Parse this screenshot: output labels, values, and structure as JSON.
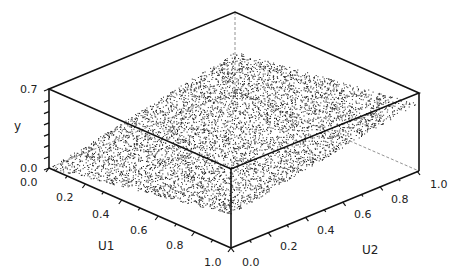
{
  "chart_data": {
    "type": "scatter",
    "subtype": "3d-scatter",
    "title": "",
    "axes": {
      "x": {
        "label": "U1",
        "range": [
          0.0,
          1.0
        ],
        "ticks": [
          "0.0",
          "0.2",
          "0.4",
          "0.6",
          "0.8",
          "1.0"
        ]
      },
      "z": {
        "label": "U2",
        "range": [
          0.0,
          1.0
        ],
        "ticks": [
          "0.0",
          "0.2",
          "0.4",
          "0.6",
          "0.8",
          "1.0"
        ]
      },
      "y": {
        "label": "y",
        "range": [
          0.0,
          0.7
        ],
        "ticks": [
          "0.0",
          "0.7"
        ]
      }
    },
    "series": [
      {
        "name": "samples",
        "description": "Dense cloud of random points (U1, U2) uniformly in unit square with y forming a smooth rising surface; y near 0 at U1=0,U2=0 and up to about 0.6 at U1=1,U2=1",
        "approx_count": 6000,
        "surface_samples": [
          {
            "U1": 0.0,
            "U2": 0.0,
            "y": 0.0
          },
          {
            "U1": 1.0,
            "U2": 0.0,
            "y": 0.3
          },
          {
            "U1": 0.0,
            "U2": 1.0,
            "y": 0.35
          },
          {
            "U1": 1.0,
            "U2": 1.0,
            "y": 0.6
          },
          {
            "U1": 0.5,
            "U2": 0.5,
            "y": 0.3
          }
        ]
      }
    ],
    "grid": false,
    "legend": null,
    "box": true
  }
}
